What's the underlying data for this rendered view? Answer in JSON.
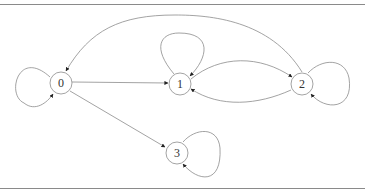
{
  "diagram": {
    "type": "directed-graph",
    "nodes": [
      {
        "id": "0",
        "label": "0",
        "cx": 61,
        "cy": 83
      },
      {
        "id": "1",
        "label": "1",
        "cx": 180,
        "cy": 84
      },
      {
        "id": "2",
        "label": "2",
        "cx": 302,
        "cy": 84
      },
      {
        "id": "3",
        "label": "3",
        "cx": 177,
        "cy": 153
      }
    ],
    "edges": [
      {
        "from": "0",
        "to": "0",
        "kind": "self-loop"
      },
      {
        "from": "0",
        "to": "1",
        "kind": "straight"
      },
      {
        "from": "0",
        "to": "3",
        "kind": "straight"
      },
      {
        "from": "1",
        "to": "1",
        "kind": "self-loop"
      },
      {
        "from": "1",
        "to": "2",
        "kind": "curved"
      },
      {
        "from": "2",
        "to": "1",
        "kind": "curved"
      },
      {
        "from": "2",
        "to": "0",
        "kind": "curved"
      },
      {
        "from": "2",
        "to": "2",
        "kind": "self-loop"
      },
      {
        "from": "3",
        "to": "3",
        "kind": "self-loop"
      }
    ],
    "colors": {
      "edge": "#8c8c8c",
      "arrowhead": "#222222",
      "node_stroke": "#8c8c8c",
      "rule": "#8a8a8a"
    }
  }
}
